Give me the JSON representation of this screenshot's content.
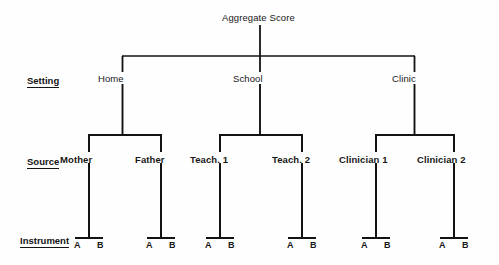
{
  "diagram": {
    "title": "Aggregate Score",
    "type": "hierarchical-tree",
    "row_labels": [
      {
        "id": "setting",
        "text": "Setting"
      },
      {
        "id": "source",
        "text": "Source"
      },
      {
        "id": "instrument",
        "text": "Instrument"
      }
    ],
    "levels": {
      "root": {
        "label": "Aggregate Score"
      },
      "setting": {
        "nodes": [
          {
            "id": "home",
            "label": "Home"
          },
          {
            "id": "school",
            "label": "School"
          },
          {
            "id": "clinic",
            "label": "Clinic"
          }
        ]
      },
      "source": {
        "nodes": [
          {
            "id": "mother",
            "label": "Mother",
            "parent": "home"
          },
          {
            "id": "father",
            "label": "Father",
            "parent": "home"
          },
          {
            "id": "teach1",
            "label": "Teach. 1",
            "parent": "school"
          },
          {
            "id": "teach2",
            "label": "Teach. 2",
            "parent": "school"
          },
          {
            "id": "clinician1",
            "label": "Clinician 1",
            "parent": "clinic"
          },
          {
            "id": "clinician2",
            "label": "Clinician 2",
            "parent": "clinic"
          }
        ]
      },
      "instrument": {
        "nodes": [
          {
            "id": "mother-a",
            "label": "A",
            "parent": "mother"
          },
          {
            "id": "mother-b",
            "label": "B",
            "parent": "mother"
          },
          {
            "id": "father-a",
            "label": "A",
            "parent": "father"
          },
          {
            "id": "father-b",
            "label": "B",
            "parent": "father"
          },
          {
            "id": "teach1-a",
            "label": "A",
            "parent": "teach1"
          },
          {
            "id": "teach1-b",
            "label": "B",
            "parent": "teach1"
          },
          {
            "id": "teach2-a",
            "label": "A",
            "parent": "teach2"
          },
          {
            "id": "teach2-b",
            "label": "B",
            "parent": "teach2"
          },
          {
            "id": "clinician1-a",
            "label": "A",
            "parent": "clinician1"
          },
          {
            "id": "clinician1-b",
            "label": "B",
            "parent": "clinician1"
          },
          {
            "id": "clinician2-a",
            "label": "A",
            "parent": "clinician2"
          },
          {
            "id": "clinician2-b",
            "label": "B",
            "parent": "clinician2"
          }
        ]
      }
    },
    "colors": {
      "line": "#131313",
      "text": "#171717",
      "background": "#fefefe"
    }
  }
}
